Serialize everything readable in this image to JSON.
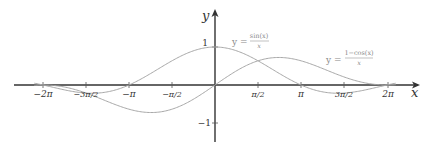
{
  "chart_data": {
    "type": "line",
    "title": "",
    "xlabel": "x",
    "ylabel": "y",
    "xlim": [
      -6.9,
      7.1
    ],
    "ylim": [
      -1.45,
      1.95
    ],
    "grid": false,
    "x_ticks": [
      "−2π",
      "−3π/2",
      "−π",
      "−π/2",
      "π/2",
      "π",
      "3π/2",
      "2π"
    ],
    "x_tick_values": [
      -6.2832,
      -4.7124,
      -3.1416,
      -1.5708,
      1.5708,
      3.1416,
      4.7124,
      6.2832
    ],
    "y_ticks": [
      "1",
      "−1"
    ],
    "y_tick_values": [
      1,
      -1
    ],
    "series": [
      {
        "name": "y = sin(x)/x",
        "label_num": "sin(x)",
        "label_den": "x",
        "formula": "sin(x)/x",
        "x": [
          -6.5,
          -6.2832,
          -4.7124,
          -3.1416,
          -1.5708,
          0,
          1.5708,
          3.1416,
          4.7124,
          6.2832,
          6.5
        ],
        "values": [
          -0.033,
          0,
          -0.212,
          0,
          0.637,
          1,
          0.637,
          0,
          -0.212,
          0,
          0.033
        ]
      },
      {
        "name": "y = (1−cos(x))/x",
        "label_num": "1−cos(x)",
        "label_den": "x",
        "formula": "(1-cos(x))/x",
        "x": [
          -6.5,
          -6.2832,
          -4.7124,
          -3.1416,
          -2.3311,
          -1.5708,
          0,
          1.5708,
          2.3311,
          3.1416,
          4.7124,
          6.2832,
          6.5
        ],
        "values": [
          -0.0054,
          0,
          -0.212,
          -0.637,
          -0.725,
          -0.637,
          0,
          0.637,
          0.725,
          0.637,
          0.212,
          0,
          0.0054
        ]
      }
    ],
    "annotations": [
      {
        "text": "y = sin(x)/x",
        "near_x": 1.7,
        "near_y": 1.1
      },
      {
        "text": "y = (1−cos(x))/x",
        "near_x": 4.8,
        "near_y": 0.6
      }
    ]
  },
  "labels": {
    "x_axis": "x",
    "y_axis": "y",
    "tick_neg2pi": "−2π",
    "tick_neg3pi2": "−3π/2",
    "tick_negpi": "−π",
    "tick_negpi2": "−π/2",
    "tick_pi2": "π/2",
    "tick_pi": "π",
    "tick_3pi2": "3π/2",
    "tick_2pi": "2π",
    "tick_1": "1",
    "tick_neg1": "−1",
    "eq1_prefix": "y =",
    "eq1_num": "sin(x)",
    "eq1_den": "x",
    "eq2_prefix": "y =",
    "eq2_num": "1−cos(x)",
    "eq2_den": "x"
  },
  "colors": {
    "axis": "#333333",
    "curve": "#a8a8a8",
    "label": "#888888"
  }
}
